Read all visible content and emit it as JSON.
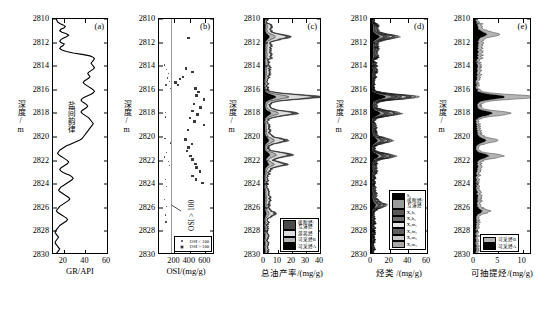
{
  "figure": {
    "axis_y_label": "深度/m",
    "y_ticks": [
      "2810",
      "2812",
      "2814",
      "2816",
      "2818",
      "2820",
      "2822",
      "2824",
      "2826",
      "2828",
      "2830"
    ],
    "y_min": 2810,
    "y_max": 2830
  },
  "panels": [
    {
      "id": "a",
      "tag": "(a)",
      "xlabel": "GR/API",
      "x_ticks": [
        "20",
        "40",
        "60"
      ],
      "x_tick_values": [
        20,
        40,
        60
      ],
      "xlim": [
        10,
        60
      ],
      "annotation": "盐间韵律"
    },
    {
      "id": "b",
      "tag": "(b)",
      "xlabel": "OSI/(mg/g)",
      "x_ticks": [
        "200",
        "400",
        "600"
      ],
      "x_tick_values": [
        200,
        400,
        600
      ],
      "xlim": [
        0,
        700
      ],
      "annotation": "OSI > 100",
      "threshold_value": 100,
      "legend": [
        {
          "marker": "small-dot",
          "label": "OSI < 100"
        },
        {
          "marker": "large-square",
          "label": "OSI > 100"
        }
      ]
    },
    {
      "id": "c",
      "tag": "(c)",
      "xlabel": "总油产率/(mg/g)",
      "x_ticks": [
        "0",
        "10",
        "20",
        "30",
        "40"
      ],
      "x_tick_values": [
        0,
        10,
        20,
        30,
        40
      ],
      "xlim": [
        0,
        40
      ],
      "legend": [
        {
          "color": "#4a4a4a",
          "label_line1": "吸附烃/",
          "label_line2": "互溶烃"
        },
        {
          "color": "#dcdcdc",
          "label": "游离烃"
        },
        {
          "color": "#b4b4b4",
          "label": "可采烃B"
        },
        {
          "color": "#000000",
          "label": "可采烃A"
        }
      ]
    },
    {
      "id": "d",
      "tag": "(d)",
      "xlabel": "烃类 /(mg/g)",
      "x_ticks": [
        "0",
        "20",
        "40",
        "60"
      ],
      "x_tick_values": [
        0,
        20,
        40,
        60
      ],
      "xlim": [
        0,
        60
      ],
      "legend": [
        {
          "color": "#000000",
          "label": "S₀"
        },
        {
          "color": "#9a9a9a",
          "label_line1": "吸附烃/",
          "label_line2": "互溶烃"
        },
        {
          "color": "#5a5a5a",
          "label": "X₁h₁"
        },
        {
          "color": "#6e6e6e",
          "label": "X₁h₂"
        },
        {
          "color": "#e6e6e6",
          "label": "X₁m₁"
        },
        {
          "color": "#606060",
          "label": "X₁m₂"
        },
        {
          "color": "#c8c8c8",
          "label": "X₁m₃"
        },
        {
          "color": "#a8a8a8",
          "label": "X₁m₄"
        }
      ]
    },
    {
      "id": "e",
      "tag": "(e)",
      "xlabel": "可抽提烃/(mg/g)",
      "x_ticks": [
        "0",
        "5",
        "10"
      ],
      "x_tick_values": [
        0,
        5,
        10
      ],
      "xlim": [
        0,
        11.5
      ],
      "legend": [
        {
          "color": "#b4b4b4",
          "label": "可采烃B"
        },
        {
          "color": "#000000",
          "label": "可采烃A"
        }
      ]
    }
  ],
  "chart_data": {
    "type": "line",
    "title": "",
    "ylabel": "深度/m",
    "ylim": [
      2810,
      2830
    ],
    "y_inverted": true,
    "panel_a": {
      "type": "line",
      "xlabel": "GR/API",
      "xlim": [
        10,
        60
      ],
      "x": [
        13,
        13.5,
        14,
        16,
        19,
        21,
        20,
        17,
        16,
        18,
        22,
        24,
        22,
        19,
        17,
        16,
        17,
        20,
        19,
        17,
        16,
        18,
        22,
        28,
        36,
        43,
        46,
        47,
        46,
        45,
        44,
        45,
        46,
        47,
        46,
        44,
        42,
        41,
        42,
        43,
        42,
        40,
        38,
        37,
        38,
        40,
        42,
        44,
        46,
        47,
        46,
        44,
        41,
        38,
        36,
        35,
        36,
        38,
        40,
        41,
        40,
        38,
        36,
        35,
        36,
        38,
        40,
        42,
        43,
        44,
        45,
        46,
        45,
        44,
        43,
        42,
        41,
        40,
        39,
        38,
        37,
        36,
        34,
        31,
        28,
        25,
        22,
        20,
        18,
        16,
        15,
        14,
        15,
        17,
        19,
        21,
        23,
        24,
        23,
        21,
        19,
        17,
        16,
        17,
        19,
        22,
        25,
        27,
        28,
        27,
        25,
        23,
        21,
        19,
        17,
        16,
        15,
        16,
        18,
        20,
        22,
        24,
        25,
        24,
        22,
        20,
        18,
        16,
        15,
        14,
        13,
        14,
        16,
        18,
        20,
        22,
        23,
        22,
        20,
        18,
        16,
        15,
        14,
        13,
        12,
        12,
        13,
        14,
        15,
        14,
        13,
        12,
        12,
        13,
        14,
        15,
        16,
        15,
        14,
        13,
        12
      ],
      "y_start": 2810,
      "y_end": 2830
    },
    "panel_b": {
      "type": "scatter",
      "xlabel": "OSI/(mg/g)",
      "xlim": [
        0,
        700
      ],
      "series_small": {
        "name": "OSI < 100",
        "points": [
          [
            70,
            2813.9
          ],
          [
            95,
            2814.3
          ],
          [
            120,
            2814.6
          ],
          [
            105,
            2815.0
          ],
          [
            135,
            2815.3
          ],
          [
            88,
            2815.6
          ],
          [
            150,
            2815.9
          ],
          [
            78,
            2817.9
          ],
          [
            82,
            2818.3
          ],
          [
            75,
            2820.1
          ],
          [
            140,
            2820.5
          ],
          [
            155,
            2820.8
          ],
          [
            92,
            2821.3
          ],
          [
            70,
            2821.7
          ],
          [
            118,
            2822.1
          ],
          [
            130,
            2822.4
          ],
          [
            85,
            2823.6
          ],
          [
            90,
            2824.2
          ],
          [
            72,
            2825.3
          ],
          [
            95,
            2825.9
          ],
          [
            80,
            2826.6
          ],
          [
            88,
            2827.2
          ]
        ]
      },
      "series_large": {
        "name": "OSI > 100",
        "points": [
          [
            370,
            2811.6
          ],
          [
            340,
            2814.2
          ],
          [
            420,
            2814.5
          ],
          [
            300,
            2814.9
          ],
          [
            260,
            2815.1
          ],
          [
            205,
            2815.4
          ],
          [
            235,
            2815.6
          ],
          [
            455,
            2815.9
          ],
          [
            495,
            2816.2
          ],
          [
            470,
            2816.5
          ],
          [
            560,
            2816.8
          ],
          [
            440,
            2817.2
          ],
          [
            520,
            2817.5
          ],
          [
            420,
            2817.8
          ],
          [
            480,
            2818.1
          ],
          [
            390,
            2818.4
          ],
          [
            445,
            2818.7
          ],
          [
            560,
            2819.0
          ],
          [
            360,
            2819.4
          ],
          [
            330,
            2820.2
          ],
          [
            410,
            2820.6
          ],
          [
            370,
            2820.9
          ],
          [
            350,
            2821.2
          ],
          [
            395,
            2821.6
          ],
          [
            420,
            2821.9
          ],
          [
            455,
            2822.3
          ],
          [
            470,
            2822.6
          ],
          [
            510,
            2822.9
          ],
          [
            420,
            2823.3
          ],
          [
            460,
            2823.6
          ],
          [
            545,
            2823.9
          ]
        ]
      }
    },
    "panel_c": {
      "type": "area-stacked",
      "xlabel": "总油产率/(mg/g)",
      "xlim": [
        0,
        40
      ],
      "series": [
        {
          "name": "可采烃A",
          "color": "#000000"
        },
        {
          "name": "可采烃B",
          "color": "#b4b4b4"
        },
        {
          "name": "游离烃",
          "color": "#dcdcdc"
        },
        {
          "name": "吸附烃/互溶烃",
          "color": "#4a4a4a"
        }
      ],
      "total_peaks": [
        [
          2811.5,
          14
        ],
        [
          2816.6,
          37
        ],
        [
          2818.0,
          21
        ],
        [
          2820.3,
          13
        ],
        [
          2821.5,
          18
        ],
        [
          2822.3,
          12
        ],
        [
          2826.5,
          6
        ]
      ]
    },
    "panel_d": {
      "type": "area-stacked",
      "xlabel": "烃类 /(mg/g)",
      "xlim": [
        0,
        60
      ],
      "total_peaks": [
        [
          2811.5,
          22
        ],
        [
          2816.6,
          45
        ],
        [
          2818.0,
          28
        ],
        [
          2820.3,
          18
        ],
        [
          2821.6,
          22
        ],
        [
          2825.8,
          12
        ]
      ]
    },
    "panel_e": {
      "type": "area-stacked",
      "xlabel": "可抽提烃/(mg/g)",
      "xlim": [
        0,
        11.5
      ],
      "series": [
        {
          "name": "可采烃B",
          "color": "#b4b4b4"
        },
        {
          "name": "可采烃A",
          "color": "#000000"
        }
      ],
      "total_peaks": [
        [
          2811.3,
          3.4
        ],
        [
          2816.6,
          11
        ],
        [
          2818.0,
          6.5
        ],
        [
          2820.3,
          3.5
        ],
        [
          2821.6,
          4.8
        ],
        [
          2826.3,
          2.2
        ]
      ]
    }
  }
}
